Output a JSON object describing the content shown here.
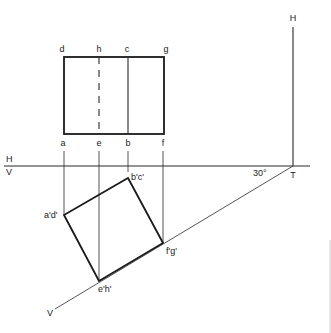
{
  "diagram": {
    "type": "orthographic-projection",
    "colors": {
      "line": "#1a1a1a",
      "background": "#ffffff"
    },
    "top_view": {
      "top_labels": [
        "d",
        "h",
        "c",
        "g"
      ],
      "bottom_labels": [
        "a",
        "e",
        "b",
        "f"
      ]
    },
    "reference_line": {
      "upper_label": "H",
      "lower_label": "V"
    },
    "auxiliary_plane": {
      "vertical_label": "H",
      "inclined_label": "V",
      "trace_label": "T",
      "angle_label": "30°"
    },
    "front_view": {
      "vertex_labels": {
        "top": "b'c'",
        "left": "a'd'",
        "right": "f'g'",
        "bottom": "e'h'"
      }
    }
  }
}
